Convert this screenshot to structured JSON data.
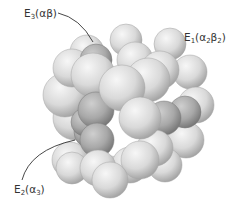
{
  "diagram": {
    "labels": [
      {
        "id": "e3",
        "text": "E3(αβ)",
        "base": "E",
        "sub": "3",
        "suffix_html": "(αβ)",
        "x": 24,
        "y": 8
      },
      {
        "id": "e1",
        "text": "E1(α2β2)",
        "base": "E",
        "sub": "1",
        "x": 184,
        "y": 33
      },
      {
        "id": "e2",
        "text": "E2(α3)",
        "base": "E",
        "sub": "2",
        "x": 14,
        "y": 184
      }
    ],
    "colors": {
      "light_subunit": "#d9d9d9",
      "dark_subunit": "#a8a8a8",
      "leader_line": "#333333",
      "label_text": "#333333"
    },
    "spheres": [
      {
        "cx": 75,
        "cy": 118,
        "r": 22,
        "shade": "light"
      },
      {
        "cx": 65,
        "cy": 95,
        "r": 22,
        "shade": "light"
      },
      {
        "cx": 87,
        "cy": 52,
        "r": 17,
        "shade": "light"
      },
      {
        "cx": 126,
        "cy": 40,
        "r": 16,
        "shade": "light"
      },
      {
        "cx": 170,
        "cy": 44,
        "r": 16,
        "shade": "light"
      },
      {
        "cx": 190,
        "cy": 72,
        "r": 17,
        "shade": "light"
      },
      {
        "cx": 196,
        "cy": 105,
        "r": 18,
        "shade": "light"
      },
      {
        "cx": 186,
        "cy": 140,
        "r": 18,
        "shade": "light"
      },
      {
        "cx": 165,
        "cy": 165,
        "r": 17,
        "shade": "light"
      },
      {
        "cx": 110,
        "cy": 175,
        "r": 19,
        "shade": "light"
      },
      {
        "cx": 70,
        "cy": 160,
        "r": 18,
        "shade": "light"
      },
      {
        "cx": 72,
        "cy": 68,
        "r": 19,
        "shade": "light"
      },
      {
        "cx": 96,
        "cy": 60,
        "r": 16,
        "shade": "dark"
      },
      {
        "cx": 135,
        "cy": 60,
        "r": 18,
        "shade": "light"
      },
      {
        "cx": 160,
        "cy": 70,
        "r": 19,
        "shade": "light"
      },
      {
        "cx": 185,
        "cy": 112,
        "r": 16,
        "shade": "dark"
      },
      {
        "cx": 164,
        "cy": 118,
        "r": 17,
        "shade": "dark"
      },
      {
        "cx": 90,
        "cy": 132,
        "r": 16,
        "shade": "dark"
      },
      {
        "cx": 93,
        "cy": 75,
        "r": 22,
        "shade": "light"
      },
      {
        "cx": 148,
        "cy": 80,
        "r": 22,
        "shade": "light"
      },
      {
        "cx": 85,
        "cy": 122,
        "r": 14,
        "shade": "dark"
      },
      {
        "cx": 96,
        "cy": 110,
        "r": 18,
        "shade": "dark"
      },
      {
        "cx": 122,
        "cy": 88,
        "r": 23,
        "shade": "light"
      },
      {
        "cx": 155,
        "cy": 148,
        "r": 18,
        "shade": "light"
      },
      {
        "cx": 130,
        "cy": 165,
        "r": 18,
        "shade": "light"
      },
      {
        "cx": 97,
        "cy": 140,
        "r": 17,
        "shade": "dark"
      },
      {
        "cx": 72,
        "cy": 168,
        "r": 16,
        "shade": "light"
      },
      {
        "cx": 98,
        "cy": 168,
        "r": 18,
        "shade": "light"
      },
      {
        "cx": 140,
        "cy": 118,
        "r": 21,
        "shade": "light"
      },
      {
        "cx": 140,
        "cy": 160,
        "r": 19,
        "shade": "light"
      },
      {
        "cx": 110,
        "cy": 180,
        "r": 18,
        "shade": "light"
      }
    ],
    "leaders": [
      {
        "id": "e3-leader",
        "d": "M58,13 Q80,18 93,42"
      },
      {
        "id": "e1-leader",
        "d": ""
      },
      {
        "id": "e2-leader",
        "d": "M22,180 Q30,150 75,140"
      }
    ]
  }
}
